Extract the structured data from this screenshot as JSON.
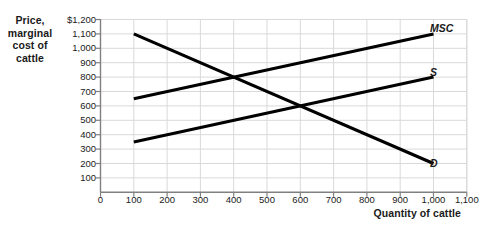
{
  "figure": {
    "y_axis_title": [
      "Price,",
      "marginal",
      "cost of",
      "cattle"
    ],
    "x_axis_title": "Quantity of cattle"
  },
  "chart_data": {
    "type": "line",
    "title": "",
    "xlabel": "Quantity of cattle",
    "ylabel": "Price, marginal cost of cattle",
    "xlim": [
      0,
      1100
    ],
    "ylim": [
      0,
      1200
    ],
    "xticks": [
      0,
      100,
      200,
      300,
      400,
      500,
      600,
      700,
      800,
      900,
      1000,
      1100
    ],
    "xtick_labels": [
      "0",
      "100",
      "200",
      "300",
      "400",
      "500",
      "600",
      "700",
      "800",
      "900",
      "1,000",
      "1,100"
    ],
    "yticks": [
      100,
      200,
      300,
      400,
      500,
      600,
      700,
      800,
      900,
      1000,
      1100,
      1200
    ],
    "ytick_labels": [
      "100",
      "200",
      "300",
      "400",
      "500",
      "600",
      "700",
      "800",
      "900",
      "1,000",
      "1,100",
      "$1,200"
    ],
    "grid": true,
    "legend_position": "inline-right",
    "line_color": "#000000",
    "grid_color": "#d9d9d9",
    "axis_color": "#808080",
    "series": [
      {
        "name": "MSC",
        "label": "MSC",
        "x": [
          100,
          1000
        ],
        "values": [
          650,
          1100
        ]
      },
      {
        "name": "S",
        "label": "S",
        "x": [
          100,
          1000
        ],
        "values": [
          350,
          800
        ]
      },
      {
        "name": "D",
        "label": "D",
        "x": [
          100,
          1000
        ],
        "values": [
          1100,
          200
        ]
      }
    ],
    "annotations": [
      {
        "text": "D intersects MSC",
        "x": 400,
        "y": 800
      },
      {
        "text": "D intersects S",
        "x": 600,
        "y": 600
      }
    ]
  }
}
